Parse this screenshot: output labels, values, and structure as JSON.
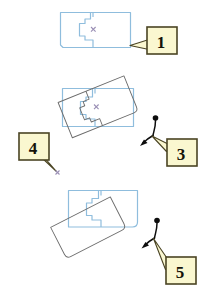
{
  "figure": {
    "width": 207,
    "height": 302,
    "background": "#ffffff",
    "type": "shape-rotation-instruction-diagram",
    "colors": {
      "shape_outline": "#8fbddd",
      "ghost_outline": "#6b6b6b",
      "callout_fill": "#faf7d0",
      "callout_border": "#4a4424",
      "callout_text": "#151208",
      "centroid_mark": "#9a8fb5",
      "handle_stroke": "#0d0d0d"
    }
  },
  "callouts": [
    {
      "id": "callout-1",
      "label": "1",
      "x": 147,
      "y": 27,
      "w": 30,
      "h": 27,
      "tail": "left"
    },
    {
      "id": "callout-3",
      "label": "3",
      "x": 167,
      "y": 139,
      "w": 30,
      "h": 27,
      "tail": "up-left"
    },
    {
      "id": "callout-4",
      "label": "4",
      "x": 19,
      "y": 133,
      "w": 30,
      "h": 27,
      "tail": "down-right"
    },
    {
      "id": "callout-5",
      "label": "5",
      "x": 166,
      "y": 257,
      "w": 30,
      "h": 27,
      "tail": "up-left"
    }
  ],
  "panels": [
    {
      "id": "panel-top",
      "name": "original-shape",
      "description": "Blue outlined parcel polygon with internal stepped subdivision and centroid cross mark",
      "shapes": [
        "outer-rectangle",
        "stepped-inner-polygon",
        "centroid-x"
      ],
      "callout": "1"
    },
    {
      "id": "panel-middle",
      "name": "rotating-shape",
      "description": "Blue original parcel with a gray rotated ghost copy superimposed, plus rotation handle",
      "shapes": [
        "outer-rectangle",
        "stepped-inner-polygon",
        "centroid-x",
        "rotated-ghost-outline",
        "rotation-handle"
      ],
      "callouts": [
        "3",
        "4"
      ]
    },
    {
      "id": "panel-bottom",
      "name": "rotated-result",
      "description": "Blue parcel with a gray rotated rounded rectangle offset below-left, plus rotation handle",
      "shapes": [
        "outer-rectangle",
        "stepped-inner-polygon",
        "rotated-ghost-rectangle",
        "rotation-handle"
      ],
      "callout": "5"
    }
  ],
  "markers": {
    "centroid_glyph": "x",
    "rotation_handle": "dot-stem-arrow"
  }
}
